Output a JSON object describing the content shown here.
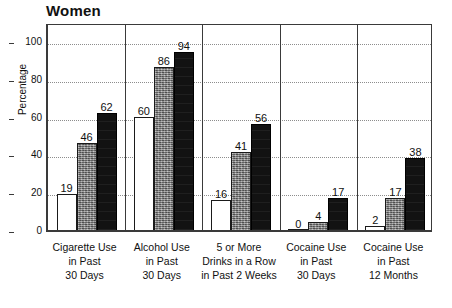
{
  "chart_data": {
    "type": "bar",
    "title": "Women",
    "xlabel": "",
    "ylabel": "Percentage",
    "ylim": [
      0,
      110
    ],
    "yticks": [
      0,
      20,
      40,
      60,
      80,
      100
    ],
    "grid": true,
    "legend": "none",
    "grouped": true,
    "series_styles": [
      "white-outline",
      "gray-hatched",
      "black-solid"
    ],
    "categories": [
      "Cigarette Use in Past 30 Days",
      "Alcohol Use in Past 30 Days",
      "5 or More Drinks in a Row in Past 2 Weeks",
      "Cocaine Use in Past 30 Days",
      "Cocaine Use in Past 12 Months"
    ],
    "category_lines": [
      [
        "Cigarette Use",
        "in Past",
        "30 Days"
      ],
      [
        "Alcohol Use",
        "in Past",
        "30 Days"
      ],
      [
        "5 or More",
        "Drinks in a Row",
        "in Past 2 Weeks"
      ],
      [
        "Cocaine Use",
        "in Past",
        "30 Days"
      ],
      [
        "Cocaine Use",
        "in Past",
        "12 Months"
      ]
    ],
    "series": [
      {
        "name": "series-1",
        "values": [
          19,
          60,
          16,
          0,
          2
        ]
      },
      {
        "name": "series-2",
        "values": [
          46,
          86,
          41,
          4,
          17
        ]
      },
      {
        "name": "series-3",
        "values": [
          62,
          94,
          56,
          17,
          38
        ]
      }
    ]
  },
  "axis": {
    "y_tick_labels": [
      "0",
      "20",
      "40",
      "60",
      "80",
      "100"
    ],
    "y_axis_title": "Percentage"
  },
  "title": {
    "text": "Women"
  },
  "value_labels": {
    "g0": [
      "19",
      "46",
      "62"
    ],
    "g1": [
      "60",
      "86",
      "94"
    ],
    "g2": [
      "16",
      "41",
      "56"
    ],
    "g3": [
      "0",
      "4",
      "17"
    ],
    "g4": [
      "2",
      "17",
      "38"
    ]
  }
}
